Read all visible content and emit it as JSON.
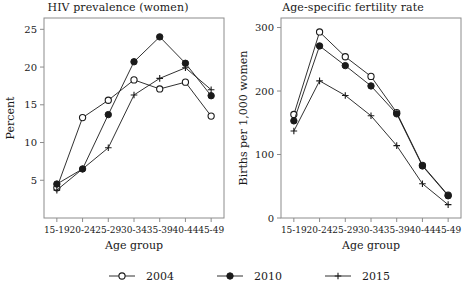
{
  "figure": {
    "background": "#ffffff",
    "ink": "#1a1a1a",
    "axis_color": "#8c8c8c"
  },
  "legend": {
    "position": "bottom-center",
    "entries": [
      {
        "label": "2004",
        "marker": "open-circle",
        "color": "#1a1a1a"
      },
      {
        "label": "2010",
        "marker": "filled-circle",
        "color": "#1a1a1a"
      },
      {
        "label": "2015",
        "marker": "plus",
        "color": "#1a1a1a"
      }
    ]
  },
  "chart_data": [
    {
      "type": "line",
      "title": "HIV prevalence (women)",
      "xlabel": "Age group",
      "ylabel": "Percent",
      "categories": [
        "15-19",
        "20-24",
        "25-29",
        "30-34",
        "35-39",
        "40-44",
        "45-49"
      ],
      "ylim": [
        0,
        26.5
      ],
      "yticks": [
        5,
        10,
        15,
        20,
        25
      ],
      "grid": false,
      "legend_position": "below-figure",
      "series": [
        {
          "name": "2004",
          "marker": "open-circle",
          "values": [
            4.0,
            13.3,
            15.6,
            18.3,
            17.1,
            18.0,
            13.5
          ]
        },
        {
          "name": "2010",
          "marker": "filled-circle",
          "values": [
            4.5,
            6.5,
            13.7,
            20.7,
            24.0,
            20.5,
            16.2
          ]
        },
        {
          "name": "2015",
          "marker": "plus",
          "values": [
            3.7,
            6.5,
            9.3,
            16.3,
            18.5,
            19.9,
            17.0
          ]
        }
      ]
    },
    {
      "type": "line",
      "title": "Age-specific fertility rate",
      "xlabel": "Age group",
      "ylabel": "Births per 1,000 women",
      "categories": [
        "15-19",
        "20-24",
        "25-29",
        "30-34",
        "35-39",
        "40-44",
        "45-49"
      ],
      "ylim": [
        0,
        315
      ],
      "yticks": [
        0,
        100,
        200,
        300
      ],
      "grid": false,
      "legend_position": "below-figure",
      "series": [
        {
          "name": "2004",
          "marker": "open-circle",
          "values": [
            163,
            293,
            254,
            223,
            166,
            83,
            36
          ]
        },
        {
          "name": "2010",
          "marker": "filled-circle",
          "values": [
            153,
            271,
            240,
            208,
            164,
            82,
            35
          ]
        },
        {
          "name": "2015",
          "marker": "plus",
          "values": [
            137,
            216,
            193,
            161,
            114,
            54,
            21
          ]
        }
      ]
    }
  ]
}
